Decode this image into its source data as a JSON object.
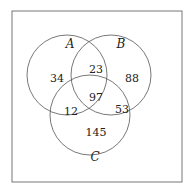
{
  "diagram": {
    "type": "venn-3",
    "sets": [
      {
        "id": "A",
        "label": "A"
      },
      {
        "id": "B",
        "label": "B"
      },
      {
        "id": "C",
        "label": "C"
      }
    ],
    "regions": {
      "A_only": "34",
      "B_only": "88",
      "C_only": "145",
      "A_and_B_only": "23",
      "A_and_C_only": "12",
      "B_and_C_only": "53",
      "A_and_B_and_C": "97"
    }
  }
}
